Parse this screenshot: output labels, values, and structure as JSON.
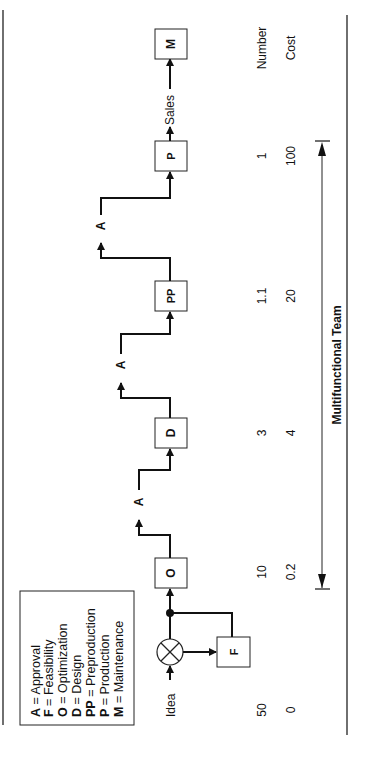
{
  "diagram": {
    "orientation": "rotated-90-ccw",
    "legend": {
      "items": [
        {
          "key": "A",
          "label": "Approval"
        },
        {
          "key": "F",
          "label": "Feasibility"
        },
        {
          "key": "O",
          "label": "Optimization"
        },
        {
          "key": "D",
          "label": "Design"
        },
        {
          "key": "PP",
          "label": "Preproduction"
        },
        {
          "key": "P",
          "label": "Production"
        },
        {
          "key": "M",
          "label": "Maintenance"
        }
      ],
      "separator": "="
    },
    "flow": {
      "start_label": "Idea",
      "nodes": {
        "F": "F",
        "O": "O",
        "D": "D",
        "PP": "PP",
        "P": "P",
        "M": "M"
      },
      "approvals": [
        "A",
        "A",
        "A"
      ],
      "sales_label": "Sales"
    },
    "rows": {
      "number_label": "Number",
      "cost_label": "Cost",
      "number_values": [
        "50",
        "10",
        "3",
        "1.1",
        "1"
      ],
      "cost_values": [
        "0",
        "0.2",
        "4",
        "20",
        "100"
      ]
    },
    "team": {
      "label": "Multifunctional Team"
    }
  }
}
